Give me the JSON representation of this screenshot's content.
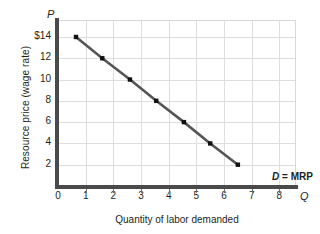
{
  "chart_data": {
    "type": "line",
    "title": "",
    "xlabel": "Quantity of labor demanded",
    "ylabel": "Resource price (wage rate)",
    "xlim": [
      0,
      8.6
    ],
    "ylim": [
      0,
      15.5
    ],
    "grid": true,
    "legend_position": "inline-annotation",
    "x_axis_letter": "Q",
    "y_axis_letter": "P",
    "origin_label": "0",
    "xticks": [
      "0",
      "1",
      "2",
      "3",
      "4",
      "5",
      "6",
      "7",
      "8"
    ],
    "xtick_values": [
      0,
      1,
      2,
      3,
      4,
      5,
      6,
      7,
      8
    ],
    "yticks": [
      "2",
      "4",
      "6",
      "8",
      "10",
      "12",
      "$14"
    ],
    "ytick_values": [
      2,
      4,
      6,
      8,
      10,
      12,
      14
    ],
    "series": [
      {
        "name": "D = MRP",
        "annotation": "D = MRP",
        "annotation_symbol": "D",
        "annotation_rest": " = MRP",
        "marker": "square",
        "line_color": "#555555",
        "marker_color": "#111111",
        "x": [
          0.65,
          1.6,
          2.6,
          3.55,
          4.55,
          5.5,
          6.5
        ],
        "y": [
          14,
          12,
          10,
          8,
          6,
          4,
          2
        ],
        "points": [
          {
            "x": 0.65,
            "y": 14
          },
          {
            "x": 1.6,
            "y": 12
          },
          {
            "x": 2.6,
            "y": 10
          },
          {
            "x": 3.55,
            "y": 8
          },
          {
            "x": 4.55,
            "y": 6
          },
          {
            "x": 5.5,
            "y": 4
          },
          {
            "x": 6.5,
            "y": 2
          }
        ]
      }
    ]
  },
  "colors": {
    "axis": "#4a4a4a",
    "grid": "#dedede",
    "text": "#231f20",
    "curve": "#555555",
    "marker": "#111111",
    "background": "#ffffff"
  }
}
